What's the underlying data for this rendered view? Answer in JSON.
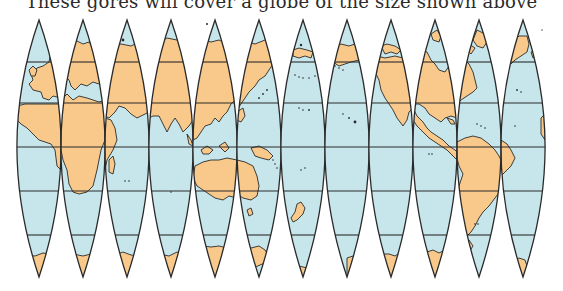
{
  "caption": "These gores will cover a globe of the size shown above",
  "colors": {
    "land": "#f8c98a",
    "ocean": "#c7e6ec",
    "lines": "#2a2a2a",
    "background": "#ffffff"
  },
  "gores": {
    "count": 12,
    "left_x": 17,
    "width": 44.2,
    "top_y": 20,
    "bottom_y": 277,
    "latitude_lines_y": [
      62,
      103,
      147,
      191,
      235
    ],
    "items": [
      {
        "index": 1,
        "region": "Atlantic / West Europe / West Africa"
      },
      {
        "index": 2,
        "region": "Europe / Africa"
      },
      {
        "index": 3,
        "region": "Arabia / East Africa / Indian Ocean"
      },
      {
        "index": 4,
        "region": "Central Asia / India / Indian Ocean"
      },
      {
        "index": 5,
        "region": "East Asia / Southeast Asia / West Australia"
      },
      {
        "index": 6,
        "region": "Japan / Pacific / East Australia"
      },
      {
        "index": 7,
        "region": "West Pacific / New Zealand"
      },
      {
        "index": 8,
        "region": "Central Pacific / Hawaii"
      },
      {
        "index": 9,
        "region": "Alaska / North Pacific"
      },
      {
        "index": 10,
        "region": "North America West / Central America"
      },
      {
        "index": 11,
        "region": "North America East / South America"
      },
      {
        "index": 12,
        "region": "Greenland / Atlantic / Brazil"
      }
    ]
  }
}
